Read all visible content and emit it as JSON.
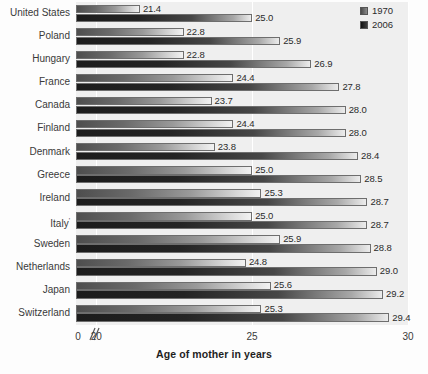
{
  "chart": {
    "type": "bar",
    "orientation": "horizontal",
    "axis_title": "Age of mother in years",
    "x_ticks": [
      "0",
      "20",
      "25",
      "30"
    ],
    "axis_break_icon": "axis-break-icon",
    "footnote_mark": "'"
  },
  "legend": {
    "position": "top-right",
    "items": [
      {
        "label": "1970",
        "swatch": "swatch-1970"
      },
      {
        "label": "2006",
        "swatch": "swatch-2006"
      }
    ]
  },
  "chart_data": {
    "type": "bar",
    "title": "",
    "subtitle": "",
    "xlabel": "Age of mother in years",
    "ylabel": "",
    "orientation": "horizontal",
    "xlim": [
      19.35,
      30
    ],
    "axis_break": true,
    "grid": true,
    "gridlines": [
      20,
      25,
      30
    ],
    "legend_position": "top-right",
    "categories": [
      "United States",
      "Poland",
      "Hungary",
      "France",
      "Canada",
      "Finland",
      "Denmark",
      "Greece",
      "Ireland",
      "Italy",
      "Sweden",
      "Netherlands",
      "Japan",
      "Switzerland"
    ],
    "series": [
      {
        "name": "1970",
        "values": [
          21.4,
          22.8,
          22.8,
          24.4,
          23.7,
          24.4,
          23.8,
          25.0,
          25.3,
          25.0,
          25.9,
          24.8,
          25.6,
          25.3
        ]
      },
      {
        "name": "2006",
        "values": [
          25.0,
          25.9,
          26.9,
          27.8,
          28.0,
          28.0,
          28.4,
          28.5,
          28.7,
          28.7,
          28.8,
          29.0,
          29.2,
          29.4
        ]
      }
    ]
  }
}
